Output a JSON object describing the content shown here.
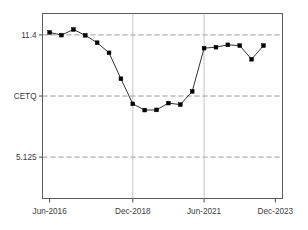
{
  "chart_data": {
    "type": "line",
    "title": "",
    "subtitle": "",
    "xlabel": "",
    "ylabel": "",
    "grid": true,
    "legend": null,
    "marker": "filled-square",
    "line_color": "#1a1a1a",
    "marker_color": "#000000",
    "grid_color": "#808080",
    "frame_color": "#555555",
    "background": "#ffffff",
    "y_ticks": [
      {
        "label": "11.4",
        "value": 11.4
      },
      {
        "label": "CETQ",
        "value": 8.2625
      },
      {
        "label": "5.125",
        "value": 5.125
      }
    ],
    "x_ticks": [
      {
        "label": "Jun-2016",
        "index": 0
      },
      {
        "label": "Dec-2018",
        "index": 7
      },
      {
        "label": "Jun-2021",
        "index": 13
      },
      {
        "label": "Dec-2023",
        "index": 19
      }
    ],
    "ylim": [
      3.0,
      12.5
    ],
    "xlim": [
      -0.6,
      19.6
    ],
    "x": [
      "Jun-2016",
      "Dec-2016",
      "Jun-2017",
      "Dec-2017",
      "Jun-2018",
      "Dec-2018-a",
      "Jun-2018b",
      "Dec-2018",
      "Jun-2019",
      "Dec-2019",
      "Jun-2020",
      "Dec-2020",
      "Jun-2021-a",
      "Jun-2021",
      "Dec-2021",
      "Jun-2022",
      "Dec-2022",
      "Jun-2023",
      "Dec-2023-a",
      "Dec-2023"
    ],
    "values": [
      11.53,
      11.39,
      11.68,
      11.38,
      11.0,
      10.48,
      9.15,
      7.86,
      7.54,
      7.55,
      7.9,
      7.82,
      8.5,
      10.72,
      10.77,
      10.89,
      10.85,
      10.15,
      10.85,
      10.85
    ],
    "series": [
      {
        "name": "series-1",
        "points": [
          {
            "x": 0,
            "label": "Jun-2016",
            "y": 11.53
          },
          {
            "x": 1,
            "label": "Dec-2016",
            "y": 11.39
          },
          {
            "x": 2,
            "label": "Jun-2017",
            "y": 11.68
          },
          {
            "x": 3,
            "label": "Dec-2017",
            "y": 11.38
          },
          {
            "x": 4,
            "label": "Jun-2018",
            "y": 11.0
          },
          {
            "x": 5,
            "label": "Dec-2018",
            "y": 10.48
          },
          {
            "x": 6,
            "label": "Jun-2019",
            "y": 9.15
          },
          {
            "x": 7,
            "label": "Dec-2019",
            "y": 7.86
          },
          {
            "x": 8,
            "label": "Jun-2020",
            "y": 7.54
          },
          {
            "x": 9,
            "label": "Dec-2020",
            "y": 7.55
          },
          {
            "x": 10,
            "label": "Jun-2021",
            "y": 7.9
          },
          {
            "x": 11,
            "label": "Dec-2021",
            "y": 7.82
          },
          {
            "x": 12,
            "label": "Jun-2022",
            "y": 8.5
          },
          {
            "x": 13,
            "label": "Dec-2022",
            "y": 10.72
          },
          {
            "x": 14,
            "label": "Jun-2023",
            "y": 10.77
          },
          {
            "x": 15,
            "label": "Dec-2023",
            "y": 10.89
          },
          {
            "x": 16,
            "label": "Jun-2024",
            "y": 10.85
          },
          {
            "x": 17,
            "label": "Dec-2024",
            "y": 10.15
          },
          {
            "x": 18,
            "label": "Jun-2025",
            "y": 10.85
          }
        ]
      }
    ]
  }
}
